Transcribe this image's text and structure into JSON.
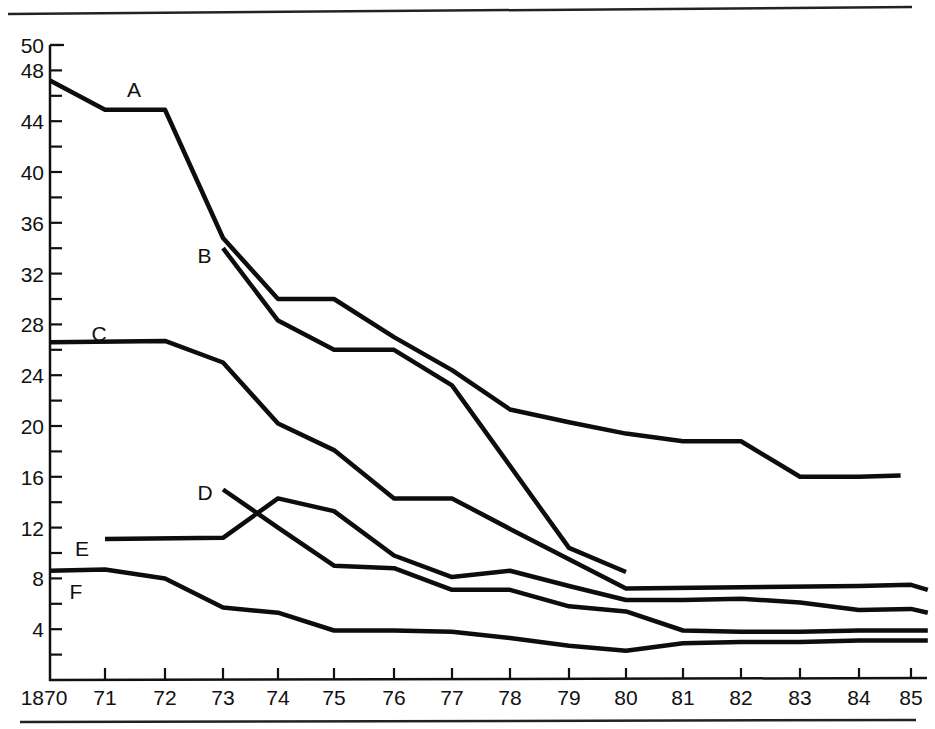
{
  "figure": {
    "title_partial": "FIGURE"
  },
  "chart_data": {
    "type": "line",
    "title": "FIGURE",
    "xlabel": "",
    "ylabel": "",
    "x": [
      1870,
      1871,
      1872,
      1873,
      1874,
      1875,
      1876,
      1877,
      1878,
      1879,
      1880,
      1881,
      1882,
      1883,
      1884,
      1885
    ],
    "x_tick_labels": [
      "1870",
      "71",
      "72",
      "73",
      "74",
      "75",
      "76",
      "77",
      "78",
      "79",
      "80",
      "81",
      "82",
      "83",
      "84",
      "85"
    ],
    "y_tick_labels": [
      "4",
      "8",
      "12",
      "16",
      "20",
      "24",
      "28",
      "32",
      "36",
      "40",
      "44",
      "48",
      "50"
    ],
    "ylim": [
      0,
      50
    ],
    "xlim": [
      1870,
      1885.3
    ],
    "grid": false,
    "legend": "inline labels",
    "series": [
      {
        "name": "A",
        "points": [
          [
            1870,
            47.2
          ],
          [
            1871,
            44.9
          ],
          [
            1872,
            44.9
          ],
          [
            1873,
            34.8
          ],
          [
            1874,
            30
          ],
          [
            1875,
            30
          ],
          [
            1876,
            27
          ],
          [
            1877,
            24.4
          ],
          [
            1878,
            21.3
          ],
          [
            1879,
            20.3
          ],
          [
            1880,
            19.4
          ],
          [
            1881,
            18.8
          ],
          [
            1882,
            18.8
          ],
          [
            1883,
            16
          ],
          [
            1884,
            16
          ],
          [
            1884.8,
            16.1
          ]
        ]
      },
      {
        "name": "B",
        "points": [
          [
            1873,
            34
          ],
          [
            1874,
            28.3
          ],
          [
            1875,
            26
          ],
          [
            1876,
            26
          ],
          [
            1877,
            23.2
          ],
          [
            1879,
            10.4
          ],
          [
            1880,
            8.5
          ]
        ]
      },
      {
        "name": "C",
        "points": [
          [
            1870,
            26.6
          ],
          [
            1872,
            26.7
          ],
          [
            1873,
            25
          ],
          [
            1874,
            20.2
          ],
          [
            1875,
            18.1
          ],
          [
            1876,
            14.3
          ],
          [
            1877,
            14.3
          ],
          [
            1878,
            11.9
          ],
          [
            1880,
            7.2
          ],
          [
            1882,
            7.3
          ],
          [
            1884,
            7.4
          ],
          [
            1885,
            7.5
          ],
          [
            1885.3,
            7.1
          ]
        ]
      },
      {
        "name": "D",
        "points": [
          [
            1873,
            15
          ],
          [
            1874,
            12
          ],
          [
            1875,
            9
          ],
          [
            1876,
            8.8
          ],
          [
            1877,
            7.1
          ],
          [
            1878,
            7.1
          ],
          [
            1879,
            5.8
          ],
          [
            1880,
            5.4
          ],
          [
            1881,
            3.9
          ],
          [
            1882,
            3.8
          ],
          [
            1883,
            3.8
          ],
          [
            1884,
            3.9
          ],
          [
            1885.3,
            3.9
          ]
        ]
      },
      {
        "name": "E",
        "points": [
          [
            1871,
            11.1
          ],
          [
            1873,
            11.2
          ],
          [
            1874,
            14.3
          ],
          [
            1875,
            13.3
          ],
          [
            1876,
            9.8
          ],
          [
            1877,
            8.1
          ],
          [
            1878,
            8.6
          ],
          [
            1879,
            7.4
          ],
          [
            1880,
            6.3
          ],
          [
            1881,
            6.3
          ],
          [
            1882,
            6.4
          ],
          [
            1883,
            6.1
          ],
          [
            1884,
            5.5
          ],
          [
            1885,
            5.6
          ],
          [
            1885.3,
            5.3
          ]
        ]
      },
      {
        "name": "F",
        "points": [
          [
            1870,
            8.6
          ],
          [
            1871,
            8.7
          ],
          [
            1872,
            8
          ],
          [
            1873,
            5.7
          ],
          [
            1874,
            5.3
          ],
          [
            1875,
            3.9
          ],
          [
            1876,
            3.9
          ],
          [
            1877,
            3.8
          ],
          [
            1878,
            3.3
          ],
          [
            1879,
            2.7
          ],
          [
            1880,
            2.3
          ],
          [
            1881,
            2.9
          ],
          [
            1882,
            3
          ],
          [
            1883,
            3
          ],
          [
            1884,
            3.1
          ],
          [
            1885.3,
            3.1
          ]
        ]
      }
    ],
    "annotations": [
      {
        "text": "A",
        "x": 1871.5,
        "y": 46.5
      },
      {
        "text": "B",
        "x": 1872.7,
        "y": 33.5
      },
      {
        "text": "C",
        "x": 1870.9,
        "y": 27.3
      },
      {
        "text": "D",
        "x": 1872.7,
        "y": 14.8
      },
      {
        "text": "E",
        "x": 1870.6,
        "y": 10.4
      },
      {
        "text": "F",
        "x": 1870.5,
        "y": 7
      }
    ]
  }
}
